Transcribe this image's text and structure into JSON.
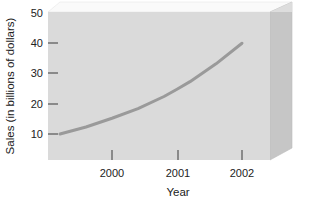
{
  "chart_data": {
    "type": "line",
    "title": "",
    "subtitle": "",
    "xlabel": "Year",
    "ylabel": "Sales (in billions of dollars)",
    "xtick_labels": [
      "2000",
      "2001",
      "2002"
    ],
    "xtick_values": [
      2000,
      2001,
      2002
    ],
    "ytick_labels": [
      "10",
      "20",
      "30",
      "40",
      "50"
    ],
    "ytick_values": [
      10,
      20,
      30,
      40,
      50
    ],
    "ylim": [
      0,
      50
    ],
    "xlim": [
      1999.2,
      2002.45
    ],
    "grid": false,
    "legend": null,
    "annotations": [],
    "series": [
      {
        "name": "Sales",
        "color": "#9a9a9a",
        "x": [
          1999.2,
          1999.6,
          2000.0,
          2000.4,
          2000.8,
          2001.0,
          2001.2,
          2001.6,
          2002.0
        ],
        "values": [
          10.0,
          12.3,
          15.2,
          18.4,
          22.4,
          24.8,
          27.3,
          33.2,
          40.0
        ]
      }
    ]
  },
  "axes": {
    "y_title": "Sales (in billions of dollars)",
    "x_title": "Year",
    "y_ticks": [
      {
        "label": "50",
        "value": 50
      },
      {
        "label": "40",
        "value": 40
      },
      {
        "label": "30",
        "value": 30
      },
      {
        "label": "20",
        "value": 20
      },
      {
        "label": "10",
        "value": 10
      }
    ],
    "x_ticks": [
      {
        "label": "2000",
        "value": 2000
      },
      {
        "label": "2001",
        "value": 2001
      },
      {
        "label": "2002",
        "value": 2002
      }
    ]
  },
  "colors": {
    "page_background": "#ffffff",
    "plot_background": "#dcdcdc",
    "plot_top_face": "#f7f7f7",
    "plot_side_face": "#c3c3c3",
    "line": "#9a9a9a",
    "text": "#222222",
    "tick_mark": "#555555"
  }
}
